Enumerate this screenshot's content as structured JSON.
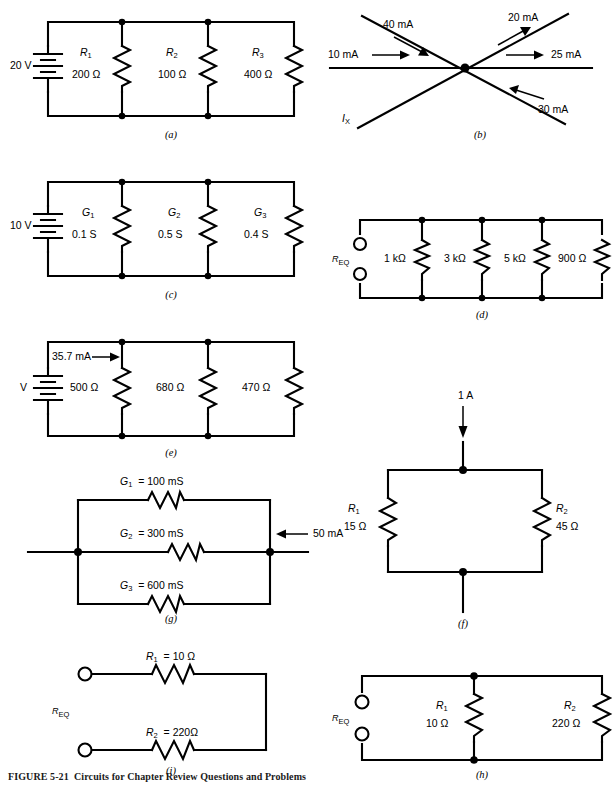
{
  "figure": {
    "caption_number": "FIGURE 5-21",
    "caption_text": "Circuits for Chapter Review Questions and Problems"
  },
  "panels": {
    "a": {
      "tag": "(a)",
      "source_label": "20 V",
      "resistors": [
        {
          "name": "R",
          "sub": "1",
          "value": "200 Ω"
        },
        {
          "name": "R",
          "sub": "2",
          "value": "100 Ω"
        },
        {
          "name": "R",
          "sub": "3",
          "value": "400 Ω"
        }
      ]
    },
    "b": {
      "tag": "(b)",
      "currents": [
        {
          "label": "40 mA"
        },
        {
          "label": "20 mA"
        },
        {
          "label": "10 mA"
        },
        {
          "label": "25 mA"
        },
        {
          "label": "30 mA"
        }
      ],
      "unknown": {
        "name": "I",
        "sub": "X"
      }
    },
    "c": {
      "tag": "(c)",
      "source_label": "10 V",
      "conductances": [
        {
          "name": "G",
          "sub": "1",
          "value": "0.1 S"
        },
        {
          "name": "G",
          "sub": "2",
          "value": "0.5 S"
        },
        {
          "name": "G",
          "sub": "3",
          "value": "0.4 S"
        }
      ]
    },
    "d": {
      "tag": "(d)",
      "terminal_label": {
        "name": "R",
        "sub": "EQ"
      },
      "resistors": [
        {
          "value": "1 kΩ"
        },
        {
          "value": "3 kΩ"
        },
        {
          "value": "5 kΩ"
        },
        {
          "value": "900 Ω"
        }
      ]
    },
    "e": {
      "tag": "(e)",
      "source_label": "V",
      "current_label": "35.7 mA",
      "resistors": [
        {
          "value": "500 Ω"
        },
        {
          "value": "680 Ω"
        },
        {
          "value": "470 Ω"
        }
      ]
    },
    "f": {
      "tag": "(f)",
      "current_label": "1 A",
      "resistors": [
        {
          "name": "R",
          "sub": "1",
          "value": "15 Ω"
        },
        {
          "name": "R",
          "sub": "2",
          "value": "45 Ω"
        }
      ]
    },
    "g": {
      "tag": "(g)",
      "current_label": "50 mA",
      "conductances": [
        {
          "name": "G",
          "sub": "1",
          "eq": "=",
          "value": "100 mS"
        },
        {
          "name": "G",
          "sub": "2",
          "eq": "=",
          "value": "300 mS"
        },
        {
          "name": "G",
          "sub": "3",
          "eq": "=",
          "value": "600 mS"
        }
      ]
    },
    "h": {
      "tag": "(h)",
      "terminal_label": {
        "name": "R",
        "sub": "EQ"
      },
      "resistors": [
        {
          "name": "R",
          "sub": "1",
          "value": "10 Ω"
        },
        {
          "name": "R",
          "sub": "2",
          "value": "220 Ω"
        }
      ]
    },
    "i": {
      "tag": "(i)",
      "terminal_label": {
        "name": "R",
        "sub": "EQ"
      },
      "resistors": [
        {
          "name": "R",
          "sub": "1",
          "eq": "=",
          "value": "10 Ω"
        },
        {
          "name": "R",
          "sub": "2",
          "eq": "=",
          "value": "220Ω"
        }
      ]
    }
  }
}
